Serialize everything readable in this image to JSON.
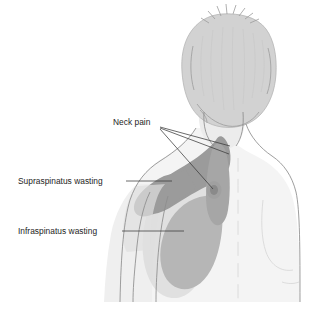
{
  "figure": {
    "background_color": "#ffffff",
    "width": 316,
    "height": 318
  },
  "labels": [
    {
      "id": "neck-pain",
      "text": "Neck pain",
      "x": 113,
      "y": 125,
      "leader_count": 3
    },
    {
      "id": "supraspinatus-wasting",
      "text": "Supraspinatus wasting",
      "x": 18,
      "y": 184,
      "leader_count": 1
    },
    {
      "id": "infraspinatus-wasting",
      "text": "Infraspinatus wasting",
      "x": 18,
      "y": 234,
      "leader_count": 1
    }
  ],
  "colors": {
    "skin": "#f2f2f2",
    "skin_shadow": "#e7e7e7",
    "hair": "#cfcfcf",
    "region_dark": "#9b9b9b",
    "region_medium": "#b6b6b6",
    "region_light": "#c6c6c6",
    "spot_dark": "#8a8a8a",
    "outline": "#8d8d8d",
    "leader": "#3a3a3a",
    "text": "#1d1d1d"
  },
  "regions": [
    {
      "id": "neck-pain-region",
      "name": "Neck pain shaded area",
      "shade": "#9b9b9b",
      "description": "Dark band across upper trapezius and side of neck"
    },
    {
      "id": "supraspinatus-region",
      "name": "Supraspinatus wasting shaded area",
      "shade": "#9b9b9b",
      "description": "Dark band over the top of the left shoulder"
    },
    {
      "id": "infraspinatus-region",
      "name": "Infraspinatus wasting shaded area",
      "shade": "#b6b6b6",
      "description": "Medium grey blob over the left scapula"
    },
    {
      "id": "neck-pain-spot",
      "name": "Neck pain focal spot",
      "shade": "#8a8a8a",
      "description": "Small oval marker medial to the shoulder"
    }
  ],
  "anatomy": [
    {
      "id": "head",
      "name": "head-with-hair"
    },
    {
      "id": "neck",
      "name": "neck"
    },
    {
      "id": "torso",
      "name": "upper-back-torso"
    },
    {
      "id": "left-arm",
      "name": "left-upper-arm"
    },
    {
      "id": "spine",
      "name": "spine-midline"
    },
    {
      "id": "right-scapula",
      "name": "right-scapula-contour"
    }
  ]
}
